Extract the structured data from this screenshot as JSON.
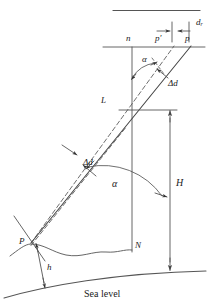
{
  "figure": {
    "type": "geometric-diagram",
    "caption": "Sea level",
    "colors": {
      "line": "#555555",
      "dash": "#555555",
      "text": "#1a1a1a",
      "background": "#ffffff"
    }
  },
  "labels": {
    "n": "n",
    "p_prime": "p'",
    "p": "p",
    "d_r": "d",
    "d_r_sub": "r",
    "alpha_top": "α",
    "delta_d_top": "Δd",
    "L": "L",
    "H": "H",
    "N": "N",
    "alpha_mid": "α",
    "delta_d_mid": "Δd",
    "P": "P",
    "h": "h",
    "sea_level": "Sea level"
  },
  "geometry": {
    "top_rule": {
      "x1": 113,
      "y1": 10,
      "x2": 200,
      "y2": 10
    },
    "horizon_line": {
      "x1": 103,
      "y1": 47,
      "x2": 205,
      "y2": 47
    },
    "vertical_nN": {
      "x": 132,
      "y1": 47,
      "y2": 250
    },
    "point_L": {
      "x": 113,
      "y": 103
    },
    "point_P": {
      "x": 31,
      "y": 243
    },
    "point_p": {
      "x": 190,
      "y": 47
    },
    "point_p_prime": {
      "x": 172,
      "y": 47
    },
    "H_dimension": {
      "x": 170,
      "y_top": 110,
      "y_bottom": 270
    },
    "h_dimension": {
      "x": 37,
      "y_top": 243,
      "y_bottom": 288
    },
    "alpha_top_deg": 38,
    "alpha_mid_deg": 38
  }
}
